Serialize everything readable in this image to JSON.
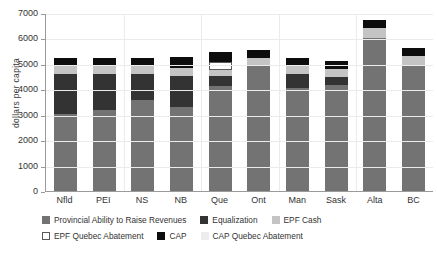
{
  "chart_data": {
    "type": "bar",
    "stacked": true,
    "title": "",
    "xlabel": "",
    "ylabel": "dollars  per capita",
    "ylim": [
      0,
      7000
    ],
    "yticks": [
      0,
      1000,
      2000,
      3000,
      4000,
      5000,
      6000,
      7000
    ],
    "ytick_labels": [
      "0",
      "1000",
      "2000",
      "3000",
      "4000",
      "5000",
      "6000",
      "7000"
    ],
    "grid": true,
    "legend_position": "bottom",
    "categories": [
      "Nfld",
      "PEI",
      "NS",
      "NB",
      "Que",
      "Ont",
      "Man",
      "Sask",
      "Alta",
      "BC"
    ],
    "series": [
      {
        "name": "Provincial Ability to Raise Revenues",
        "color": "#737373",
        "values": [
          3030,
          3200,
          3570,
          3320,
          4130,
          4960,
          4070,
          4150,
          6010,
          4960
        ]
      },
      {
        "name": "Equalization",
        "color": "#333333",
        "values": [
          1570,
          1400,
          1020,
          1220,
          390,
          0,
          550,
          350,
          0,
          0
        ]
      },
      {
        "name": "EPF Cash",
        "color": "#c4c4c4",
        "values": [
          315,
          315,
          335,
          315,
          240,
          275,
          315,
          315,
          390,
          350
        ]
      },
      {
        "name": "EPF Quebec Abatement",
        "color": "#ffffff",
        "values": [
          0,
          0,
          0,
          0,
          310,
          0,
          0,
          0,
          0,
          0
        ]
      },
      {
        "name": "CAP",
        "color": "#0d0d0d",
        "values": [
          315,
          315,
          315,
          415,
          400,
          310,
          300,
          295,
          320,
          310
        ]
      },
      {
        "name": "CAP Quebec Abatement",
        "color": "#ededed",
        "values": [
          0,
          0,
          0,
          0,
          0,
          0,
          0,
          0,
          0,
          0
        ]
      }
    ],
    "totals": [
      5230,
      5230,
      5240,
      5270,
      5470,
      5545,
      5235,
      5110,
      6720,
      5620
    ]
  }
}
